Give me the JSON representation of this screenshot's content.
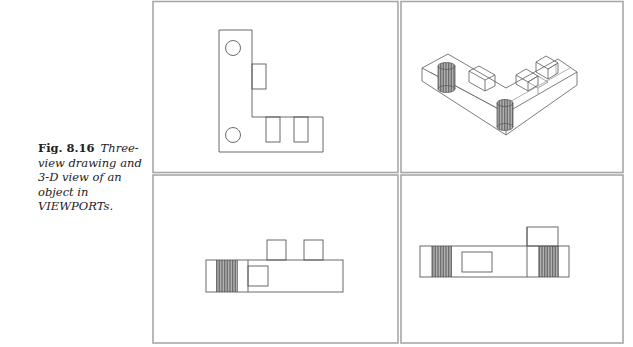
{
  "figure": {
    "number": "Fig. 8.16",
    "caption": "Three-view drawing and 3-D view of an object in VIEWPORTs."
  },
  "viewports": [
    {
      "name": "top-view",
      "position": "top-left",
      "description": "Plan view of L-shaped block with two holes and three rectangular bosses"
    },
    {
      "name": "isometric-view",
      "position": "top-right",
      "description": "3-D wireframe view of L-shaped block with two cylinders and blocks"
    },
    {
      "name": "front-view",
      "position": "bottom-left",
      "description": "Front elevation with hatched cylinder section and two top bosses"
    },
    {
      "name": "side-view",
      "position": "bottom-right",
      "description": "Side elevation with two hatched cylinder sections and one top boss"
    }
  ],
  "colors": {
    "frame": "#a8a8a8",
    "line": "#5a5a5a",
    "hatch": "#555555",
    "background": "#ffffff"
  }
}
